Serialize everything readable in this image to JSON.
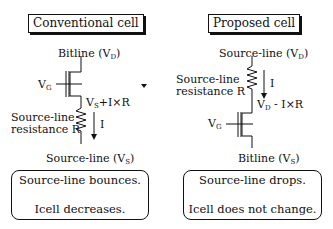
{
  "left": {
    "title": "Conventional cell",
    "top_terminal": {
      "text": "Bitline (V",
      "sub": "D",
      "close": ")"
    },
    "gate": {
      "text": "V",
      "sub": "G"
    },
    "node": {
      "text": "V",
      "sub": "S",
      "rest": "+I×R"
    },
    "resistor_label_1": "Source-line",
    "resistor_label_2": "resistance R",
    "current": "I",
    "bottom_terminal": {
      "text": "Source-line (V",
      "sub": "S",
      "close": ")"
    },
    "result_1": "Source-line bounces.",
    "result_2": "Icell decreases."
  },
  "right": {
    "title": "Proposed cell",
    "top_terminal": {
      "text": "Source-line (V",
      "sub": "D",
      "close": ")"
    },
    "resistor_label_1": "Source-line",
    "resistor_label_2": "resistance R",
    "current": "I",
    "node": {
      "text": "V",
      "sub": "D",
      "rest": " - I×R"
    },
    "gate": {
      "text": "V",
      "sub": "G"
    },
    "bottom_terminal": {
      "text": "Bitline (V",
      "sub": "S",
      "close": ")"
    },
    "result_1": "Source-line drops.",
    "result_2": "Icell does not change."
  }
}
